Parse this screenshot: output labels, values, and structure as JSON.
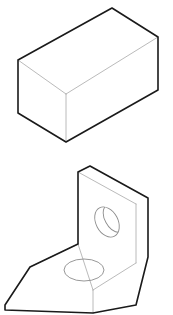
{
  "sheet": {
    "title": "isometric-technical-drawing-sheet",
    "background_color": "#ffffff",
    "width": 173,
    "height": 315,
    "figure_count": 2
  },
  "style": {
    "outline_color": "#1a1a1a",
    "interior_edge_color": "#a8a8a8",
    "hole_edge_color": "#8c8c8c",
    "face_fill": "#ffffff",
    "outline_width": 1.6,
    "interior_width": 0.8,
    "hole_width": 0.9
  },
  "figures": [
    {
      "id": "figure-1",
      "name": "rectangular-block",
      "label": "Rectangular block (isometric)",
      "description": "A solid rectangular prism drawn in isometric projection showing top, left-front and right-front faces.",
      "projection": "isometric",
      "visible_faces": [
        "top",
        "front-left",
        "front-right"
      ],
      "hole_count": 0,
      "geometry": {
        "top_face": "18,60 112,8 158,37 66,94",
        "left_face": "18,60 66,94 66,142 18,113",
        "right_face": "66,94 158,37 158,90 66,142",
        "outline": "18,60 112,8 158,37 158,90 66,142 18,113",
        "interior_edges": [
          "18,60 66,94",
          "66,94 158,37",
          "66,94 66,142"
        ]
      }
    },
    {
      "id": "figure-2",
      "name": "angle-bracket-with-holes",
      "label": "L-shaped angle bracket (isometric)",
      "description": "An L-shaped angle bracket in isometric projection with a through hole in the upright plate and a through hole in the horizontal base. The lower edge is cropped by the image border.",
      "projection": "isometric",
      "visible_faces": [
        "upright-front",
        "upright-top",
        "upright-side",
        "base-top",
        "base-front-left",
        "base-front-right"
      ],
      "hole_count": 2,
      "cropped_at_bottom": true,
      "geometry": {
        "upright_front_face": "78,17 136,49 136,108 78,89",
        "upright_top_face": "78,17 90,11 148,43 136,49",
        "upright_side_face": "136,49 148,43 148,102 136,108",
        "base_top_face": "78,89 136,108 93,135 30,112",
        "base_front_left_face": "30,112 93,135 93,158 5,155 5,150",
        "base_front_right_face": "93,135 136,108 136,150 93,158",
        "outline": "78,17 90,11 148,43 148,102 136,150 93,158 5,155 5,150 30,112 78,89",
        "interior_edges": [
          "78,17 136,49",
          "136,49 136,108",
          "136,108 93,135",
          "93,135 78,89",
          "93,135 93,158",
          "78,89 30,112"
        ]
      },
      "holes": [
        {
          "name": "upright-plate-hole",
          "location": "upright-plate",
          "shape": "through-hole",
          "center_x": 107,
          "center_y": 67,
          "rx": 11,
          "ry": 16,
          "rotation_deg": -28,
          "has_inner_bore_arc": true
        },
        {
          "name": "base-plate-hole",
          "location": "horizontal-base",
          "shape": "through-hole",
          "center_x": 84,
          "center_y": 115,
          "rx": 20,
          "ry": 11,
          "rotation_deg": 0,
          "has_inner_bore_arc": false
        }
      ]
    }
  ]
}
